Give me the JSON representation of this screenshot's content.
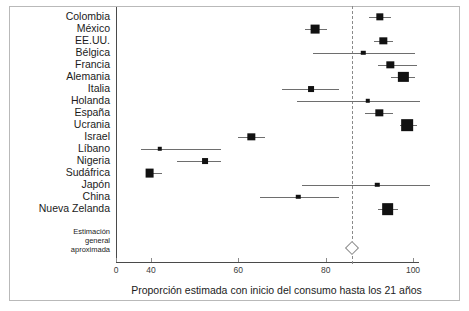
{
  "chart_data": {
    "type": "scatter",
    "plot_style": "forest-plot",
    "title": "",
    "xlabel": "Proporción estimada con inicio del consumo hasta los 21 años",
    "ylabel": "",
    "xlim": [
      0,
      104
    ],
    "axis_break": {
      "from": 0,
      "to": 40
    },
    "xticks": [
      0,
      40,
      60,
      80,
      100
    ],
    "xticklabels": [
      "0",
      "40",
      "60",
      "80",
      "100"
    ],
    "grid": false,
    "legend": false,
    "reference_line": {
      "value": 86,
      "style": "dashed",
      "label": ""
    },
    "categories": [
      "Colombia",
      "México",
      "EE.UU.",
      "Bélgica",
      "Francia",
      "Alemania",
      "Italia",
      "Holanda",
      "España",
      "Ucrania",
      "Israel",
      "Líbano",
      "Nigeria",
      "Sudáfrica",
      "Japón",
      "China",
      "Nueva Zelanda"
    ],
    "points": [
      {
        "label": "Colombia",
        "value": 92.4,
        "ci_low": 90.0,
        "ci_high": 95.0,
        "weight": 3
      },
      {
        "label": "México",
        "value": 77.6,
        "ci_low": 75.2,
        "ci_high": 80.3,
        "weight": 4
      },
      {
        "label": "EE.UU.",
        "value": 93.2,
        "ci_low": 91.0,
        "ci_high": 95.5,
        "weight": 3
      },
      {
        "label": "Bélgica",
        "value": 88.6,
        "ci_low": 77.0,
        "ci_high": 100.5,
        "weight": 1
      },
      {
        "label": "Francia",
        "value": 94.8,
        "ci_low": 92.0,
        "ci_high": 101.0,
        "weight": 3
      },
      {
        "label": "Alemania",
        "value": 97.8,
        "ci_low": 95.0,
        "ci_high": 100.5,
        "weight": 5
      },
      {
        "label": "Italia",
        "value": 76.7,
        "ci_low": 70.0,
        "ci_high": 83.0,
        "weight": 2
      },
      {
        "label": "Holanda",
        "value": 89.7,
        "ci_low": 73.5,
        "ci_high": 101.5,
        "weight": 1
      },
      {
        "label": "España",
        "value": 92.3,
        "ci_low": 89.0,
        "ci_high": 95.5,
        "weight": 3
      },
      {
        "label": "Ucrania",
        "value": 98.7,
        "ci_low": 97.0,
        "ci_high": 101.0,
        "weight": 6
      },
      {
        "label": "Israel",
        "value": 63.0,
        "ci_low": 60.0,
        "ci_high": 66.0,
        "weight": 3
      },
      {
        "label": "Líbano",
        "value": 42.0,
        "ci_low": 28.5,
        "ci_high": 56.0,
        "weight": 1
      },
      {
        "label": "Nigeria",
        "value": 52.4,
        "ci_low": 46.0,
        "ci_high": 56.0,
        "weight": 2
      },
      {
        "label": "Sudáfrica",
        "value": 38.5,
        "ci_low": 34.5,
        "ci_high": 42.5,
        "weight": 4
      },
      {
        "label": "Japón",
        "value": 91.8,
        "ci_low": 74.5,
        "ci_high": 104.0,
        "weight": 1
      },
      {
        "label": "China",
        "value": 73.7,
        "ci_low": 65.0,
        "ci_high": 83.0,
        "weight": 1
      },
      {
        "label": "Nueva Zelanda",
        "value": 94.2,
        "ci_low": 92.0,
        "ci_high": 96.5,
        "weight": 6
      }
    ],
    "overall": {
      "label_lines": [
        "Estimación",
        "general",
        "aproximada"
      ],
      "value": 86.0,
      "ci_low": 85.0,
      "ci_high": 87.0,
      "marker": "diamond"
    }
  },
  "colors": {
    "marker": "#111111",
    "ci": "#6e6e6e",
    "axis": "#4a4a4a",
    "reference_line": "#8a8a8a",
    "frame": "#b9b9b9",
    "text": "#1b1b1b"
  }
}
